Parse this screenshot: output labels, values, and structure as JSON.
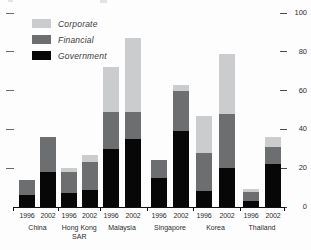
{
  "chart_data": {
    "type": "bar",
    "stacked": true,
    "title": "",
    "stack_order": [
      "government",
      "financial",
      "corporate"
    ],
    "colors": {
      "corporate": "#cbcccd",
      "financial": "#6d6e70",
      "government": "#070707"
    },
    "legend": [
      {
        "key": "corporate",
        "label": "Corporate"
      },
      {
        "key": "financial",
        "label": "Financial"
      },
      {
        "key": "government",
        "label": "Government"
      }
    ],
    "legend_position": "top-left",
    "grid": false,
    "y_axis": {
      "label_side": "right",
      "range": [
        0,
        100
      ],
      "ticks": [
        100,
        80,
        60,
        40,
        20,
        0
      ],
      "left_tick_marks": [
        100,
        80,
        60,
        40,
        20
      ]
    },
    "groups": [
      {
        "country": "China",
        "bars": [
          {
            "year": "1996",
            "government": 6,
            "financial": 8,
            "corporate": 0
          },
          {
            "year": "2002",
            "government": 18,
            "financial": 18,
            "corporate": 0
          }
        ]
      },
      {
        "country": "Hong Kong SAR",
        "bars": [
          {
            "year": "1996",
            "government": 7,
            "financial": 11,
            "corporate": 2
          },
          {
            "year": "2002",
            "government": 9,
            "financial": 14,
            "corporate": 4
          }
        ]
      },
      {
        "country": "Malaysia",
        "bars": [
          {
            "year": "1996",
            "government": 30,
            "financial": 19,
            "corporate": 23
          },
          {
            "year": "2002",
            "government": 35,
            "financial": 14,
            "corporate": 38
          }
        ]
      },
      {
        "country": "Singapore",
        "bars": [
          {
            "year": "1996",
            "government": 15,
            "financial": 9,
            "corporate": 0
          },
          {
            "year": "2002",
            "government": 39,
            "financial": 21,
            "corporate": 3
          }
        ]
      },
      {
        "country": "Korea",
        "bars": [
          {
            "year": "1996",
            "government": 8,
            "financial": 20,
            "corporate": 19
          },
          {
            "year": "2002",
            "government": 20,
            "financial": 28,
            "corporate": 31
          }
        ]
      },
      {
        "country": "Thailand",
        "bars": [
          {
            "year": "1996",
            "government": 3,
            "financial": 4.5,
            "corporate": 2
          },
          {
            "year": "2002",
            "government": 22,
            "financial": 9,
            "corporate": 5
          }
        ]
      }
    ]
  }
}
